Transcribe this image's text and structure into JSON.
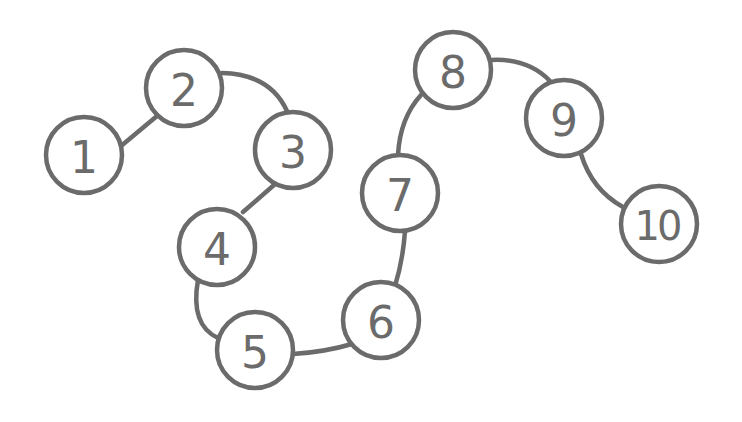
{
  "diagram": {
    "type": "numbered-path",
    "colors": {
      "stroke": "#6b6b6b",
      "fill": "#ffffff",
      "background": "#ffffff"
    },
    "nodes": [
      {
        "id": 1,
        "label": "1"
      },
      {
        "id": 2,
        "label": "2"
      },
      {
        "id": 3,
        "label": "3"
      },
      {
        "id": 4,
        "label": "4"
      },
      {
        "id": 5,
        "label": "5"
      },
      {
        "id": 6,
        "label": "6"
      },
      {
        "id": 7,
        "label": "7"
      },
      {
        "id": 8,
        "label": "8"
      },
      {
        "id": 9,
        "label": "9"
      },
      {
        "id": 10,
        "label": "10"
      }
    ],
    "edges": [
      [
        "1",
        "2"
      ],
      [
        "2",
        "3"
      ],
      [
        "3",
        "4"
      ],
      [
        "4",
        "5"
      ],
      [
        "5",
        "6"
      ],
      [
        "6",
        "7"
      ],
      [
        "7",
        "8"
      ],
      [
        "8",
        "9"
      ],
      [
        "9",
        "10"
      ]
    ]
  }
}
